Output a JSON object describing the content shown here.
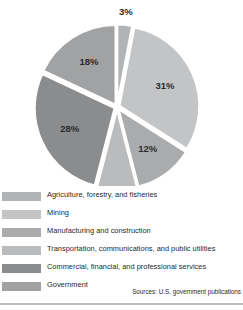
{
  "chart_data": {
    "type": "pie",
    "title": "",
    "subtitle": "",
    "xlabel": "",
    "ylabel": "",
    "legend_position": "bottom",
    "exploded": true,
    "value_suffix": "%",
    "categories": [
      "Agriculture, forestry, and fisheries",
      "Mining",
      "Manufacturing and construction",
      "Transportation, communications, and public utilities",
      "Commercial, financial, and professional services",
      "Government"
    ],
    "values": [
      3,
      31,
      12,
      8,
      28,
      18
    ],
    "labels": [
      "3%",
      "31%",
      "12%",
      "8%",
      "28%",
      "18%"
    ],
    "colors": [
      "#b1b4b6",
      "#c2c4c6",
      "#a9abad",
      "#b9bbbd",
      "#8a8c8e",
      "#a0a2a4"
    ],
    "slices": [
      {
        "label": "3%",
        "value": 3,
        "category": "Agriculture, forestry, and fisheries",
        "color": "#b1b4b6"
      },
      {
        "label": "31%",
        "value": 31,
        "category": "Mining",
        "color": "#c2c4c6"
      },
      {
        "label": "12%",
        "value": 12,
        "category": "Manufacturing and construction",
        "color": "#a9abad"
      },
      {
        "label": "8%",
        "value": 8,
        "category": "Transportation, communications, and public utilities",
        "color": "#b9bbbd"
      },
      {
        "label": "28%",
        "value": 28,
        "category": "Commercial, financial, and professional services",
        "color": "#8a8c8e"
      },
      {
        "label": "18%",
        "value": 18,
        "category": "Government",
        "color": "#a0a2a4"
      }
    ]
  },
  "legend": {
    "items": [
      {
        "label": "Agriculture, forestry, and fisheries",
        "color": "#b1b4b6"
      },
      {
        "label": "Mining",
        "color": "#c2c4c6"
      },
      {
        "label": "Manufacturing and construction",
        "color": "#a9abad"
      },
      {
        "label": "Transportation, communications, and public utilities",
        "color": "#b9bbbd"
      },
      {
        "label": "Commercial, financial, and professional services",
        "color": "#8a8c8e"
      },
      {
        "label": "Government",
        "color": "#a0a2a4"
      }
    ]
  },
  "source": {
    "text": "Sources: U.S. government publications"
  }
}
